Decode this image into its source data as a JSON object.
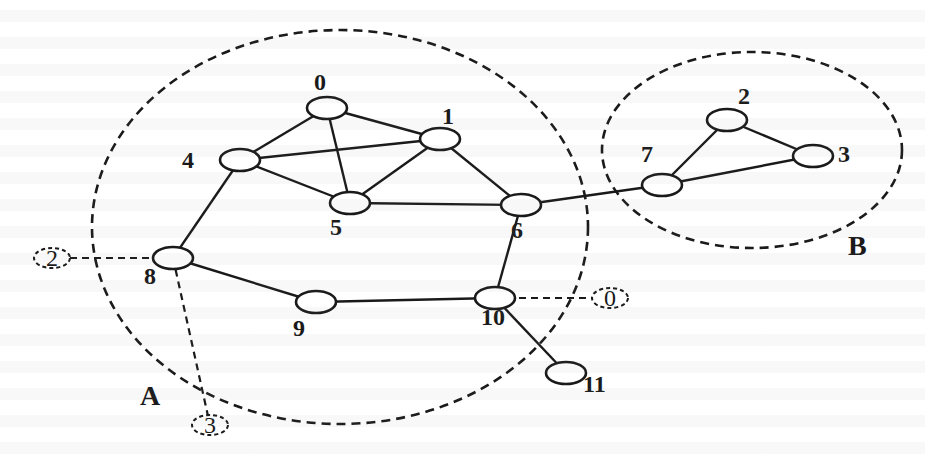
{
  "figure": {
    "type": "network-graph"
  },
  "regions": [
    {
      "id": "A",
      "label": "A",
      "cx": 340,
      "cy": 227,
      "rx": 248,
      "ry": 197,
      "label_x": 140,
      "label_y": 405
    },
    {
      "id": "B",
      "label": "B",
      "cx": 752,
      "cy": 150,
      "rx": 150,
      "ry": 98,
      "label_x": 848,
      "label_y": 255
    }
  ],
  "nodes": [
    {
      "id": "0",
      "label": "0",
      "cx": 327,
      "cy": 108,
      "label_x": 314,
      "label_y": 90
    },
    {
      "id": "1",
      "label": "1",
      "cx": 440,
      "cy": 139,
      "label_x": 442,
      "label_y": 124
    },
    {
      "id": "2",
      "label": "2",
      "cx": 727,
      "cy": 120,
      "label_x": 738,
      "label_y": 104
    },
    {
      "id": "3",
      "label": "3",
      "cx": 813,
      "cy": 156,
      "label_x": 838,
      "label_y": 162
    },
    {
      "id": "4",
      "label": "4",
      "cx": 240,
      "cy": 160,
      "label_x": 182,
      "label_y": 168
    },
    {
      "id": "5",
      "label": "5",
      "cx": 350,
      "cy": 203,
      "label_x": 330,
      "label_y": 235
    },
    {
      "id": "6",
      "label": "6",
      "cx": 521,
      "cy": 205,
      "label_x": 511,
      "label_y": 238
    },
    {
      "id": "7",
      "label": "7",
      "cx": 662,
      "cy": 185,
      "label_x": 641,
      "label_y": 162
    },
    {
      "id": "8",
      "label": "8",
      "cx": 173,
      "cy": 258,
      "label_x": 144,
      "label_y": 284
    },
    {
      "id": "9",
      "label": "9",
      "cx": 316,
      "cy": 302,
      "label_x": 293,
      "label_y": 336
    },
    {
      "id": "10",
      "label": "10",
      "cx": 495,
      "cy": 298,
      "label_x": 481,
      "label_y": 325
    },
    {
      "id": "11",
      "label": "11",
      "cx": 566,
      "cy": 373,
      "label_x": 583,
      "label_y": 392
    }
  ],
  "edges": [
    {
      "from": "0",
      "to": "1"
    },
    {
      "from": "0",
      "to": "4"
    },
    {
      "from": "0",
      "to": "5"
    },
    {
      "from": "1",
      "to": "4"
    },
    {
      "from": "1",
      "to": "5"
    },
    {
      "from": "1",
      "to": "6"
    },
    {
      "from": "4",
      "to": "5"
    },
    {
      "from": "4",
      "to": "8"
    },
    {
      "from": "5",
      "to": "6"
    },
    {
      "from": "6",
      "to": "7"
    },
    {
      "from": "6",
      "to": "10"
    },
    {
      "from": "7",
      "to": "2"
    },
    {
      "from": "7",
      "to": "3"
    },
    {
      "from": "2",
      "to": "3"
    },
    {
      "from": "8",
      "to": "9"
    },
    {
      "from": "9",
      "to": "10"
    },
    {
      "from": "10",
      "to": "11"
    }
  ],
  "ghost_nodes": [
    {
      "id": "g2",
      "label": "2",
      "cx": 52,
      "cy": 258,
      "attached_to": "8"
    },
    {
      "id": "g3",
      "label": "3",
      "cx": 210,
      "cy": 425,
      "attached_to": "8"
    },
    {
      "id": "g0",
      "label": "0",
      "cx": 610,
      "cy": 298,
      "attached_to": "10"
    }
  ],
  "background_note": "Faint illegible bleed-through text from reverse side of page"
}
